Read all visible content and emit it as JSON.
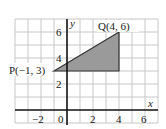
{
  "diagram": {
    "type": "coordinate-grid",
    "x_axis_label": "x",
    "y_axis_label": "y",
    "x_range": [
      -4,
      7
    ],
    "y_range": [
      -1,
      7
    ],
    "x_tick_labels": [
      "−2",
      "0",
      "2",
      "4",
      "6"
    ],
    "y_tick_labels": [
      "2",
      "4",
      "6"
    ],
    "grid_color": "#c8c8c8",
    "axis_color": "#111111",
    "shape": {
      "type": "triangle",
      "fill": "#9a9a9a",
      "stroke": "#333333",
      "vertices": [
        [
          -1,
          3
        ],
        [
          4,
          6
        ],
        [
          4,
          3
        ]
      ]
    },
    "points": [
      {
        "name": "P",
        "label": "P(−1, 3)",
        "x": -1,
        "y": 3
      },
      {
        "name": "Q",
        "label": "Q(4, 6)",
        "x": 4,
        "y": 6
      }
    ]
  }
}
